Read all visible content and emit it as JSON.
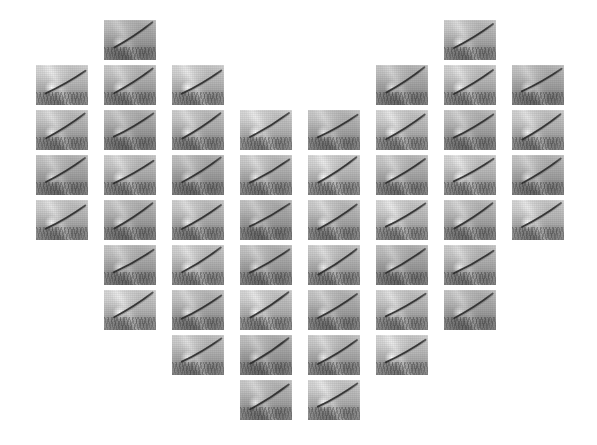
{
  "canvas": {
    "width": 597,
    "height": 445,
    "background_color": "#ffffff",
    "description": "Heart-shaped mosaic of small grayscale thumbnail photographs"
  },
  "mosaic": {
    "shape": "heart",
    "tile_count": 48,
    "tile_width": 52,
    "tile_height": 40,
    "column_pitch": 68,
    "row_pitch": 45,
    "origin_x": 36,
    "origin_y": 20,
    "tile_background_color": "#b0b0b0",
    "tile_streak_color": "#2b2b2b",
    "rows": [
      {
        "row": 1,
        "columns": [
          1,
          6
        ]
      },
      {
        "row": 2,
        "columns": [
          0,
          1,
          2,
          5,
          6,
          7
        ]
      },
      {
        "row": 3,
        "columns": [
          0,
          1,
          2,
          3,
          4,
          5,
          6,
          7
        ]
      },
      {
        "row": 4,
        "columns": [
          0,
          1,
          2,
          3,
          4,
          5,
          6,
          7
        ]
      },
      {
        "row": 5,
        "columns": [
          0,
          1,
          2,
          3,
          4,
          5,
          6,
          7
        ]
      },
      {
        "row": 6,
        "columns": [
          1,
          2,
          3,
          4,
          5,
          6
        ]
      },
      {
        "row": 7,
        "columns": [
          1,
          2,
          3,
          4,
          5,
          6
        ]
      },
      {
        "row": 8,
        "columns": [
          2,
          3,
          4,
          5
        ]
      },
      {
        "row": 9,
        "columns": [
          3,
          4
        ]
      }
    ]
  },
  "tile": {
    "label": "thumbnail",
    "content_description": "grayscale photo of a dark diagonal cable rising left-to-right over a textured field"
  }
}
